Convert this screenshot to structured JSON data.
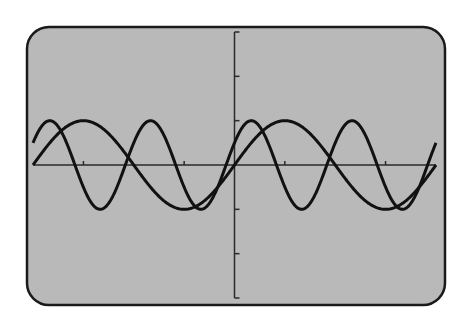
{
  "colors": {
    "page_background": "#ffffff",
    "screen_fill": "#b9b9b9",
    "frame_stroke": "#1a1a1a",
    "axis_stroke": "#2a2a2a",
    "curve_stroke": "#111111"
  },
  "chart_data": {
    "type": "line",
    "title": "",
    "xlabel": "",
    "ylabel": "",
    "xlim": [
      -6.2832,
      6.2832
    ],
    "ylim": [
      -3,
      3
    ],
    "grid": false,
    "legend": null,
    "x_ticks": [
      -4.71,
      -1.57,
      1.57,
      4.71
    ],
    "y_ticks": [
      -3,
      -2,
      -1,
      1,
      2,
      3
    ],
    "series": [
      {
        "name": "y1 = sin(x)",
        "amplitude": 1,
        "frequency": 1,
        "phase": 0
      },
      {
        "name": "y2 = sin(2x + π/6)",
        "amplitude": 1,
        "frequency": 2,
        "phase": 0.5236
      }
    ],
    "samples": {
      "x": [
        -6.28,
        -5.5,
        -4.71,
        -3.93,
        -3.14,
        -2.36,
        -1.57,
        -0.79,
        0,
        0.79,
        1.57,
        2.36,
        3.14,
        3.93,
        4.71,
        5.5,
        6.28
      ],
      "y1": [
        0,
        0.71,
        1,
        0.71,
        0,
        -0.71,
        -1,
        -0.71,
        0,
        0.71,
        1,
        0.71,
        0,
        -0.71,
        -1,
        -0.71,
        0
      ],
      "y2": [
        0.5,
        0.87,
        -0.5,
        -0.87,
        0.5,
        0.87,
        -0.5,
        -0.87,
        0.5,
        0.87,
        -0.5,
        -0.87,
        0.5,
        0.87,
        -0.5,
        -0.87,
        0.5
      ]
    }
  },
  "layout": {
    "frame": {
      "x": 27,
      "y": 27,
      "w": 418,
      "h": 278,
      "r": 22
    },
    "plot": {
      "x0": 33,
      "x1": 436,
      "y_top": 32,
      "y_bottom": 298,
      "origin_x": 236,
      "origin_y": 164
    }
  }
}
